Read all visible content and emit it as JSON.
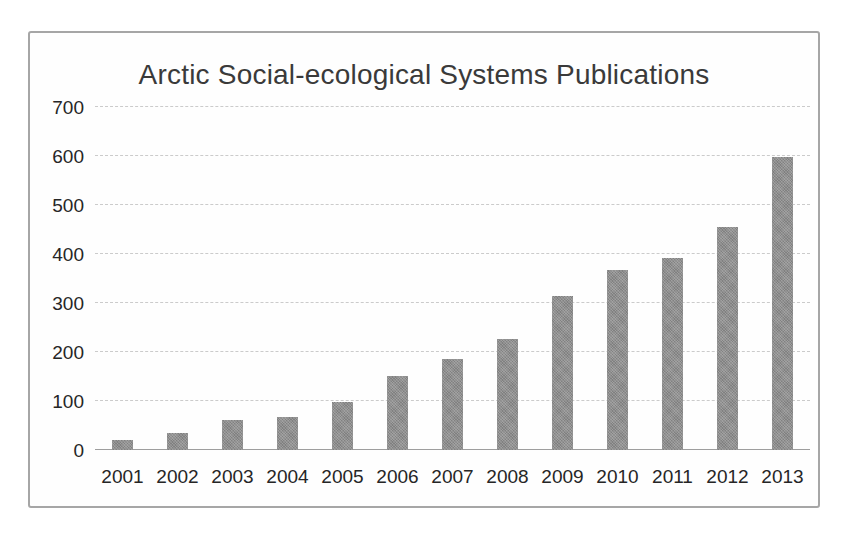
{
  "chart_data": {
    "type": "bar",
    "title": "Arctic Social-ecological Systems Publications",
    "categories": [
      "2001",
      "2002",
      "2003",
      "2004",
      "2005",
      "2006",
      "2007",
      "2008",
      "2009",
      "2010",
      "2011",
      "2012",
      "2013"
    ],
    "values": [
      20,
      34,
      62,
      67,
      98,
      151,
      186,
      226,
      315,
      367,
      391,
      455,
      597
    ],
    "series": [
      {
        "name": "Publications",
        "values": [
          20,
          34,
          62,
          67,
          98,
          151,
          186,
          226,
          315,
          367,
          391,
          455,
          597
        ]
      }
    ],
    "xlabel": "",
    "ylabel": "",
    "ylim": [
      0,
      700
    ],
    "ytick_step": 100,
    "yticks": [
      "0",
      "100",
      "200",
      "300",
      "400",
      "500",
      "600",
      "700"
    ],
    "grid": true,
    "legend_position": "none",
    "colors": {
      "bar": "#8f8f8f",
      "gridline": "#cbcbcb",
      "axis_line": "#9e9e9e",
      "frame_border": "#a6a6a6",
      "title": "#3a3a3a",
      "tick_label": "#262626"
    }
  }
}
